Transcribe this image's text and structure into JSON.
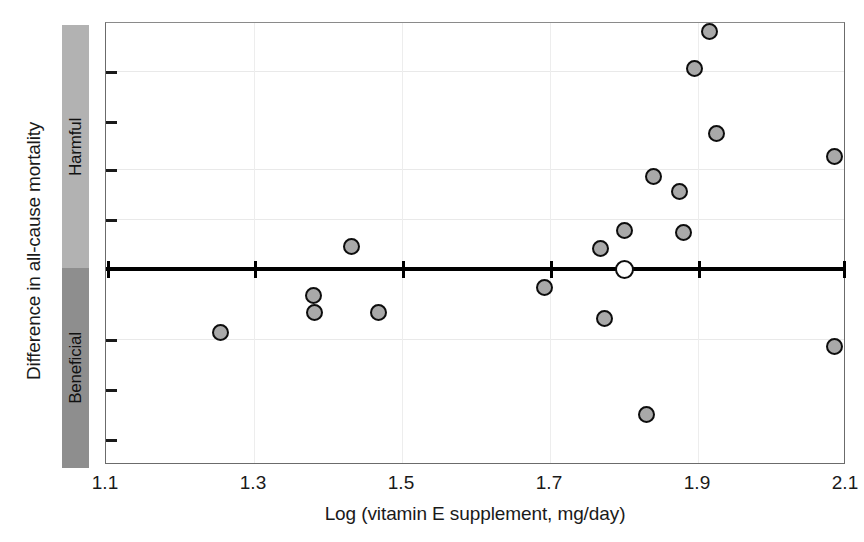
{
  "chart_data": {
    "type": "scatter",
    "title": "",
    "xlabel": "Log (vitamin E supplement, mg/day)",
    "ylabel": "Difference in all-cause mortality",
    "xlim": [
      1.1,
      2.1
    ],
    "xticks": [
      "1.1",
      "1.3",
      "1.5",
      "1.7",
      "1.9",
      "2.1"
    ],
    "xtick_values": [
      1.1,
      1.3,
      1.5,
      1.7,
      1.9,
      2.1
    ],
    "grid": true,
    "legend": "none",
    "reference_line": {
      "y": 0,
      "label": "no difference"
    },
    "y_direction_bands": [
      {
        "label": "Harmful",
        "region": "above-zero",
        "color": "#b2b2b2"
      },
      {
        "label": "Beneficial",
        "region": "below-zero",
        "color": "#8e8e8e"
      }
    ],
    "series": [
      {
        "name": "individual trials",
        "marker": "filled-circle",
        "color": "#a9a9a9",
        "points": [
          {
            "x": 1.255,
            "y": -0.155
          },
          {
            "x": 1.38,
            "y": -0.065
          },
          {
            "x": 1.382,
            "y": -0.105
          },
          {
            "x": 1.432,
            "y": 0.055
          },
          {
            "x": 1.468,
            "y": -0.105
          },
          {
            "x": 1.693,
            "y": -0.045
          },
          {
            "x": 1.768,
            "y": 0.05
          },
          {
            "x": 1.773,
            "y": -0.12
          },
          {
            "x": 1.8,
            "y": 0.095
          },
          {
            "x": 1.83,
            "y": -0.355
          },
          {
            "x": 1.84,
            "y": 0.225
          },
          {
            "x": 1.875,
            "y": 0.19
          },
          {
            "x": 1.88,
            "y": 0.09
          },
          {
            "x": 1.895,
            "y": 0.49
          },
          {
            "x": 1.915,
            "y": 0.58
          },
          {
            "x": 1.925,
            "y": 0.33
          },
          {
            "x": 2.085,
            "y": 0.275
          },
          {
            "x": 2.085,
            "y": -0.19
          }
        ]
      },
      {
        "name": "pooled estimate",
        "marker": "open-circle",
        "color": "#ffffff",
        "points": [
          {
            "x": 1.8,
            "y": 0.0
          }
        ]
      }
    ]
  }
}
